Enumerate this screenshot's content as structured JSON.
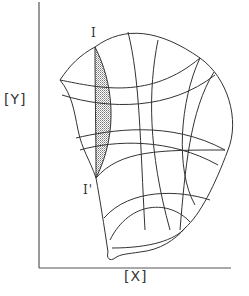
{
  "diagram": {
    "type": "phase-space / grid deformation diagram",
    "axes": {
      "y_label": "[Y]",
      "x_label": "[X]"
    },
    "points": [
      {
        "id": "I",
        "label": "I"
      },
      {
        "id": "I_prime",
        "label": "I'"
      }
    ],
    "shaded_region": {
      "description": "stippled lens-shaped region between I and I'",
      "fill": "#bdbdbd"
    },
    "colors": {
      "line": "#333333",
      "axis": "#555555",
      "background": "#ffffff"
    }
  }
}
